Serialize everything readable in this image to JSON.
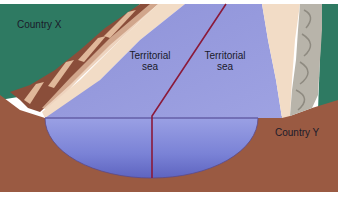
{
  "diagram": {
    "type": "cross-section",
    "labels": {
      "country_x": "Country X",
      "country_y": "Country Y",
      "sea_left_line1": "Territorial",
      "sea_left_line2": "sea",
      "sea_right_line1": "Territorial",
      "sea_right_line2": "sea"
    },
    "colors": {
      "land_green": "#2e7a62",
      "land_brown": "#9a5a42",
      "sea_blue": "#8a8fd8",
      "sea_basin": "#6f78cf",
      "beach": "#f2dcc6",
      "boundary_line": "#8b1a3a",
      "rock_grey": "#b8b4aa"
    }
  }
}
